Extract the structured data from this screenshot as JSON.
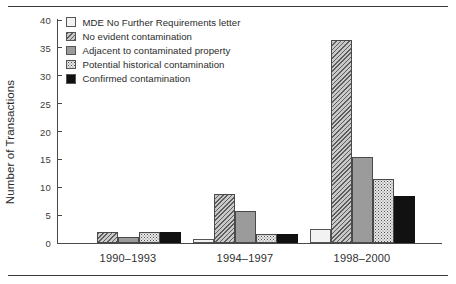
{
  "chart_data": {
    "type": "bar",
    "title": "",
    "xlabel": "",
    "ylabel": "Number of Transactions",
    "categories": [
      "1990–1993",
      "1994–1997",
      "1998–2000"
    ],
    "ylim": [
      0,
      40
    ],
    "yticks": [
      0,
      5,
      10,
      15,
      20,
      25,
      30,
      35,
      40
    ],
    "ytick_labels": [
      "0",
      "5",
      "10",
      "15",
      "20",
      "25",
      "30",
      "35",
      "40"
    ],
    "grid": false,
    "legend_position": "top-left",
    "series": [
      {
        "name": "MDE No Further Requirements letter",
        "pattern": "open-white",
        "color": "#f2f2f2",
        "values": [
          0,
          0.8,
          2.5
        ]
      },
      {
        "name": "No evident contamination",
        "pattern": "diagonal-hatch",
        "color": "#c9c9c9",
        "values": [
          2,
          8.8,
          36.5
        ]
      },
      {
        "name": "Adjacent to contaminated property",
        "pattern": "solid-gray",
        "color": "#9b9b9b",
        "values": [
          1,
          5.7,
          15.5
        ]
      },
      {
        "name": "Potential historical contamination",
        "pattern": "speckled",
        "color": "#e8e8e8",
        "values": [
          2,
          1.7,
          11.4
        ]
      },
      {
        "name": "Confirmed contamination",
        "pattern": "solid-black",
        "color": "#111111",
        "values": [
          1.9,
          1.6,
          8.4
        ]
      }
    ]
  }
}
